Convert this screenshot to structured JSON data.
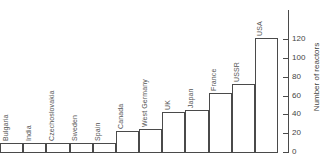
{
  "chart_data": {
    "type": "bar",
    "title": "",
    "xlabel": "",
    "ylabel": "Number of reactors",
    "ylim": [
      0,
      130
    ],
    "yticks": [
      0,
      20,
      40,
      60,
      80,
      100,
      120
    ],
    "ytick_labels": [
      "0",
      "20",
      "40",
      "60",
      "80",
      "100",
      "120"
    ],
    "grid": false,
    "legend": "none",
    "axis_position": "right",
    "categories": [
      "Bulgaria",
      "India",
      "Czechoslovakia",
      "Sweden",
      "Spain",
      "Canada",
      "West Germany",
      "UK",
      "Japan",
      "France",
      "USSR",
      "USA"
    ],
    "values": [
      10,
      10,
      10,
      10,
      10,
      22,
      24,
      43,
      45,
      63,
      72,
      121
    ]
  },
  "axis": {
    "title": "Number of reactors"
  }
}
